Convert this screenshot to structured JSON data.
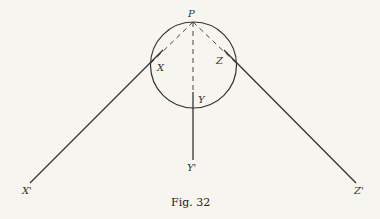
{
  "figure": {
    "caption": "Fig. 32",
    "labels": {
      "P": "P",
      "X": "X",
      "Y": "Y",
      "Z": "Z",
      "X_prime": "X'",
      "Y_prime": "Y'",
      "Z_prime": "Z'"
    },
    "stroke_color": "#333333",
    "background_color": "#f7f5ef"
  }
}
